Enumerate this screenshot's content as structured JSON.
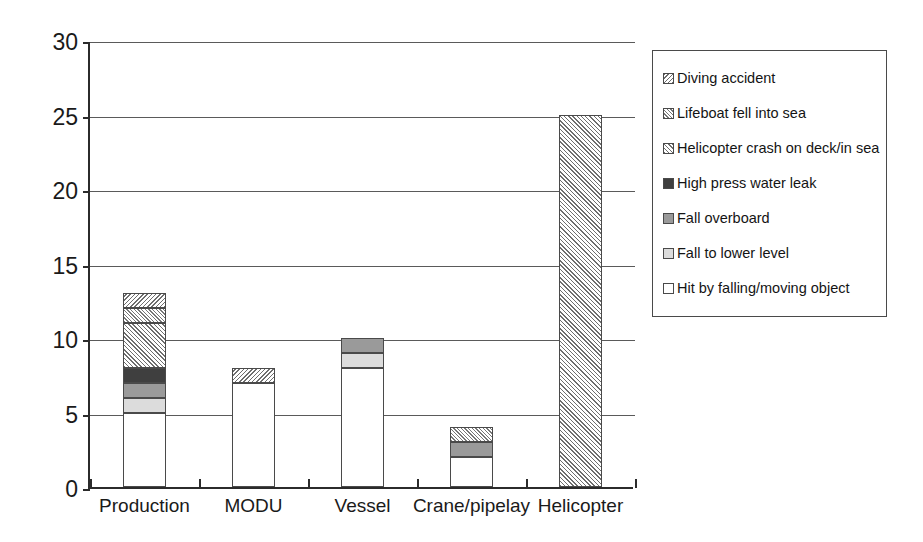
{
  "chart_data": {
    "type": "bar",
    "stacked": true,
    "title": "",
    "xlabel": "",
    "ylabel": "",
    "ylim": [
      0,
      30
    ],
    "ytick_step": 5,
    "ytick_labels": [
      "0",
      "5",
      "10",
      "15",
      "20",
      "25",
      "30"
    ],
    "grid": true,
    "legend_position": "right",
    "categories": [
      "Production",
      "MODU",
      "Vessel",
      "Crane/pipelay",
      "Helicopter"
    ],
    "series": [
      {
        "name": "Hit by falling/moving object",
        "fill": "fill-white",
        "values": [
          5,
          7,
          8,
          2,
          0
        ]
      },
      {
        "name": "Fall to lower level",
        "fill": "fill-light",
        "values": [
          1,
          0,
          1,
          0,
          0
        ]
      },
      {
        "name": "Fall overboard",
        "fill": "fill-medium",
        "values": [
          1,
          0,
          1,
          1,
          0
        ]
      },
      {
        "name": "High press water leak",
        "fill": "fill-dark",
        "values": [
          1,
          0,
          0,
          0,
          0
        ]
      },
      {
        "name": "Helicopter crash on deck/in sea",
        "fill": "fill-hatch",
        "values": [
          3,
          0,
          0,
          0,
          25
        ]
      },
      {
        "name": "Lifeboat fell into sea",
        "fill": "fill-hatch-dense",
        "values": [
          1,
          0,
          0,
          1,
          0
        ]
      },
      {
        "name": "Diving accident",
        "fill": "fill-hatch-back",
        "values": [
          1,
          1,
          0,
          0,
          0
        ]
      }
    ],
    "totals": [
      13,
      8,
      10,
      4,
      25
    ]
  },
  "legend": {
    "items": [
      {
        "label": "Diving accident",
        "fill": "fill-hatch-back",
        "icon": "legend-swatch-icon"
      },
      {
        "label": "Lifeboat fell into sea",
        "fill": "fill-hatch-dense",
        "icon": "legend-swatch-icon"
      },
      {
        "label": "Helicopter crash on deck/in sea",
        "fill": "fill-hatch",
        "icon": "legend-swatch-icon"
      },
      {
        "label": "High press water leak",
        "fill": "fill-dark",
        "icon": "legend-swatch-icon"
      },
      {
        "label": "Fall overboard",
        "fill": "fill-medium",
        "icon": "legend-swatch-icon"
      },
      {
        "label": "Fall to lower level",
        "fill": "fill-light",
        "icon": "legend-swatch-icon"
      },
      {
        "label": "Hit by falling/moving object",
        "fill": "fill-white",
        "icon": "legend-swatch-icon"
      }
    ]
  },
  "colors": {
    "axis": "#2b2b2b",
    "gridline": "#5a5a5a",
    "bar_outline": "#4a4a4a",
    "text": "#1a1a1a",
    "background": "#ffffff"
  }
}
